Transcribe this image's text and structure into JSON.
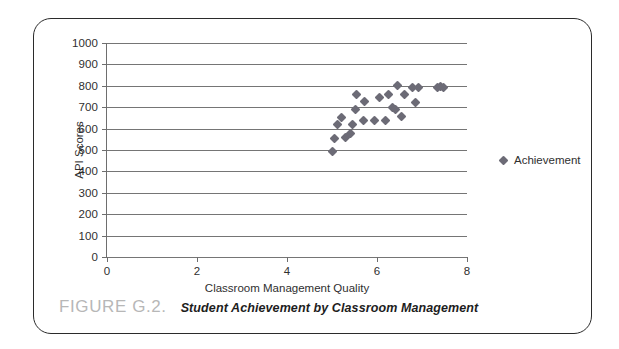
{
  "figure": {
    "caption_number": "FIGURE G.2.",
    "caption_title": "Student Achievement by Classroom Management"
  },
  "legend": {
    "label": "Achievement",
    "marker_color": "#6c6b76",
    "position": "right"
  },
  "chart_data": {
    "type": "scatter",
    "title": "",
    "xlabel": "Classroom Management Quality",
    "ylabel": "API Scores",
    "xlim": [
      0,
      8
    ],
    "ylim": [
      0,
      1000
    ],
    "xticks": [
      0,
      2,
      4,
      6,
      8
    ],
    "yticks": [
      0,
      100,
      200,
      300,
      400,
      500,
      600,
      700,
      800,
      900,
      1000
    ],
    "grid": "horizontal",
    "marker": "diamond",
    "series": [
      {
        "name": "Achievement",
        "color": "#6c6b76",
        "points": [
          [
            5.02,
            492
          ],
          [
            5.05,
            555
          ],
          [
            5.12,
            620
          ],
          [
            5.2,
            650
          ],
          [
            5.3,
            558
          ],
          [
            5.42,
            578
          ],
          [
            5.45,
            620
          ],
          [
            5.52,
            690
          ],
          [
            5.55,
            760
          ],
          [
            5.7,
            640
          ],
          [
            5.72,
            728
          ],
          [
            5.95,
            640
          ],
          [
            6.05,
            745
          ],
          [
            6.18,
            640
          ],
          [
            6.25,
            760
          ],
          [
            6.35,
            700
          ],
          [
            6.4,
            690
          ],
          [
            6.45,
            800
          ],
          [
            6.55,
            655
          ],
          [
            6.62,
            760
          ],
          [
            6.78,
            790
          ],
          [
            6.85,
            722
          ],
          [
            6.92,
            790
          ],
          [
            7.35,
            792
          ],
          [
            7.42,
            795
          ],
          [
            7.48,
            790
          ]
        ]
      }
    ]
  },
  "axis": {
    "x_tick_labels": [
      "0",
      "2",
      "4",
      "6",
      "8"
    ],
    "y_tick_labels": [
      "0",
      "100",
      "200",
      "300",
      "400",
      "500",
      "600",
      "700",
      "800",
      "900",
      "1000"
    ]
  }
}
